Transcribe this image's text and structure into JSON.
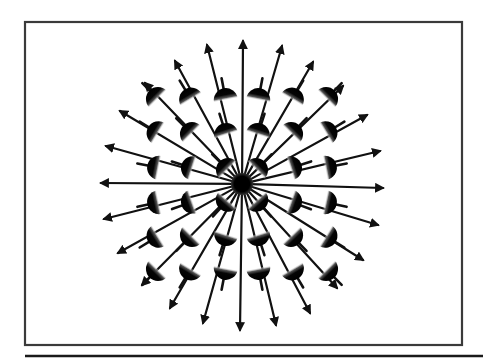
{
  "figure": {
    "title": "",
    "colors": {
      "ink": "#111111",
      "frame": "#3a3a3a",
      "background": "#ffffff"
    },
    "frame": {
      "x": 25,
      "y": 22,
      "width": 437,
      "height": 323
    },
    "bottom_rule": {
      "x1": 25,
      "y1": 356,
      "x2": 483,
      "y2": 356
    },
    "center_charge": {
      "x": 242,
      "y": 184,
      "radius": 11
    },
    "dipole_grid": {
      "columns_x": [
        155,
        189,
        225,
        259,
        294,
        329
      ],
      "rows_y": [
        96,
        131,
        167,
        203,
        238,
        272
      ],
      "radius": 12
    },
    "field_arrows": [
      {
        "x2": 243,
        "y2": 41
      },
      {
        "x2": 207,
        "y2": 45
      },
      {
        "x2": 282,
        "y2": 46
      },
      {
        "x2": 175,
        "y2": 61
      },
      {
        "x2": 313,
        "y2": 62
      },
      {
        "x2": 145,
        "y2": 83
      },
      {
        "x2": 343,
        "y2": 86
      },
      {
        "x2": 120,
        "y2": 111
      },
      {
        "x2": 367,
        "y2": 115
      },
      {
        "x2": 106,
        "y2": 146
      },
      {
        "x2": 380,
        "y2": 151
      },
      {
        "x2": 101,
        "y2": 183
      },
      {
        "x2": 383,
        "y2": 188
      },
      {
        "x2": 104,
        "y2": 219
      },
      {
        "x2": 378,
        "y2": 225
      },
      {
        "x2": 118,
        "y2": 253
      },
      {
        "x2": 363,
        "y2": 260
      },
      {
        "x2": 142,
        "y2": 285
      },
      {
        "x2": 337,
        "y2": 288
      },
      {
        "x2": 170,
        "y2": 308
      },
      {
        "x2": 310,
        "y2": 313
      },
      {
        "x2": 203,
        "y2": 323
      },
      {
        "x2": 276,
        "y2": 325
      },
      {
        "x2": 240,
        "y2": 330
      }
    ]
  }
}
